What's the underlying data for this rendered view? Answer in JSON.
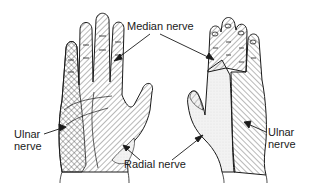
{
  "figure": {
    "left_hand_view": "palmar",
    "right_hand_view": "dorsal"
  },
  "labels": {
    "median": "Median nerve",
    "ulnar_left_line1": "Ulnar",
    "ulnar_left_line2": "nerve",
    "ulnar_right_line1": "Ulnar",
    "ulnar_right_line2": "nerve",
    "radial": "Radial nerve"
  },
  "legend": {
    "median_pattern": "diagonal-hatch-with-dashes",
    "ulnar_pattern": "diagonal-hatch-opposite",
    "radial_pattern": "stippled-dots"
  },
  "colors": {
    "ink": "#1a1a1a",
    "background": "#ffffff",
    "stipple": "#e6e6e6"
  }
}
